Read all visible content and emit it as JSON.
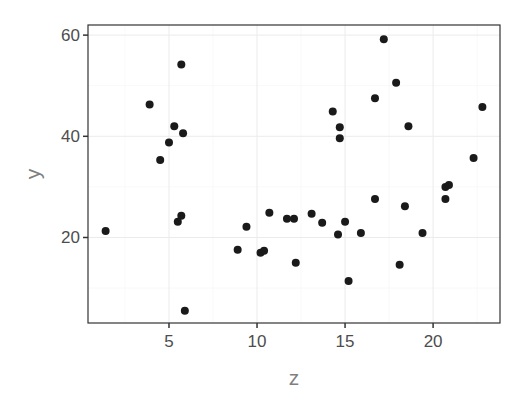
{
  "chart_data": {
    "type": "scatter",
    "title": "",
    "xlabel": "z",
    "ylabel": "y",
    "xlim": [
      0.4,
      23.8
    ],
    "ylim": [
      3.1,
      62.0
    ],
    "xticks": [
      5,
      10,
      15,
      20
    ],
    "yticks": [
      20,
      40,
      60
    ],
    "grid": true,
    "legend": null,
    "point_color": "#1a1a1a",
    "points": [
      {
        "x": 1.4,
        "y": 21.3
      },
      {
        "x": 3.9,
        "y": 46.3
      },
      {
        "x": 4.5,
        "y": 35.3
      },
      {
        "x": 5.0,
        "y": 38.8
      },
      {
        "x": 5.3,
        "y": 42.0
      },
      {
        "x": 5.7,
        "y": 54.2
      },
      {
        "x": 5.8,
        "y": 40.6
      },
      {
        "x": 5.5,
        "y": 23.1
      },
      {
        "x": 5.7,
        "y": 24.3
      },
      {
        "x": 5.9,
        "y": 5.5
      },
      {
        "x": 8.9,
        "y": 17.6
      },
      {
        "x": 9.4,
        "y": 22.1
      },
      {
        "x": 10.2,
        "y": 17.0
      },
      {
        "x": 10.4,
        "y": 17.4
      },
      {
        "x": 10.7,
        "y": 24.9
      },
      {
        "x": 11.7,
        "y": 23.7
      },
      {
        "x": 12.1,
        "y": 23.7
      },
      {
        "x": 12.2,
        "y": 15.0
      },
      {
        "x": 13.1,
        "y": 24.7
      },
      {
        "x": 13.7,
        "y": 22.9
      },
      {
        "x": 14.3,
        "y": 44.9
      },
      {
        "x": 14.6,
        "y": 20.6
      },
      {
        "x": 14.7,
        "y": 39.6
      },
      {
        "x": 14.7,
        "y": 41.8
      },
      {
        "x": 15.0,
        "y": 23.1
      },
      {
        "x": 15.2,
        "y": 11.4
      },
      {
        "x": 15.9,
        "y": 20.9
      },
      {
        "x": 16.7,
        "y": 47.5
      },
      {
        "x": 16.7,
        "y": 27.6
      },
      {
        "x": 17.2,
        "y": 59.2
      },
      {
        "x": 17.9,
        "y": 50.6
      },
      {
        "x": 18.1,
        "y": 14.6
      },
      {
        "x": 18.4,
        "y": 26.2
      },
      {
        "x": 18.6,
        "y": 42.0
      },
      {
        "x": 19.4,
        "y": 20.9
      },
      {
        "x": 20.7,
        "y": 27.6
      },
      {
        "x": 20.7,
        "y": 30.0
      },
      {
        "x": 20.9,
        "y": 30.4
      },
      {
        "x": 22.3,
        "y": 35.7
      },
      {
        "x": 22.8,
        "y": 45.8
      }
    ]
  }
}
